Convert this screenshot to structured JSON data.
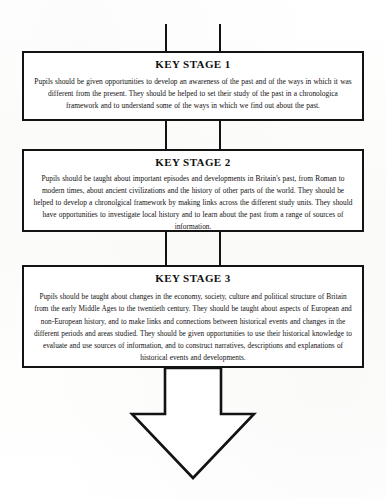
{
  "document": {
    "type": "flow-diagram",
    "subject": "History National Curriculum Key Stages"
  },
  "stages": [
    {
      "id": "key-stage-1",
      "title": "KEY STAGE 1",
      "body": "Pupils should be given opportunities to develop an awareness of the past and of the ways in which it was different from the present. They should be helped to set their study of the past in a chronologica framework and to understand some of the ways in which we find out about the past."
    },
    {
      "id": "key-stage-2",
      "title": "KEY STAGE 2",
      "body": "Pupils should be taught about important episodes and developments in Britain's past, from Roman to modern times, about ancient civilizations and the history of other parts of the world. They should be helped to develop a chronolgical framework by making links across the different study units.   They should have opportunities to investigate local history and to learn about the past from a range of sources of information."
    },
    {
      "id": "key-stage-3",
      "title": "KEY STAGE 3",
      "body": "Pupils should be taught about changes in the economy, society, culture and political structure of Britain from the early Middle Ages to the twentieth century. They should be taught about aspects of European and non-European history, and to make links and connections between historical events and changes in the different periods and areas studied. They should be given opportunities to use their historical knowledge to evaluate and use sources of information, and to construct narratives, descriptions and explanations of historical  events and developments."
    }
  ],
  "connectors": {
    "top_stub": "vertical-connector",
    "ks1_to_ks2": "vertical-connector",
    "ks2_to_ks3": "vertical-connector",
    "terminal": "down-arrow"
  },
  "colors": {
    "ink": "#131313",
    "paper": "#ffffff"
  }
}
